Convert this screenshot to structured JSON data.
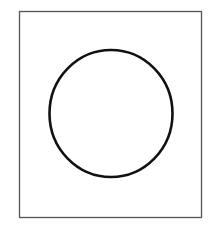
{
  "figure": {
    "shapes": [
      {
        "type": "rectangle",
        "name": "outer-frame",
        "x": 19.5,
        "y": 11.5,
        "width": 182,
        "height": 206,
        "stroke": "#555555",
        "stroke_width": 1.3
      },
      {
        "type": "ellipse",
        "name": "circle",
        "cx": 111,
        "cy": 113.5,
        "rx": 61.5,
        "ry": 63.5,
        "stroke": "#111111",
        "stroke_width": 2.6
      }
    ]
  }
}
